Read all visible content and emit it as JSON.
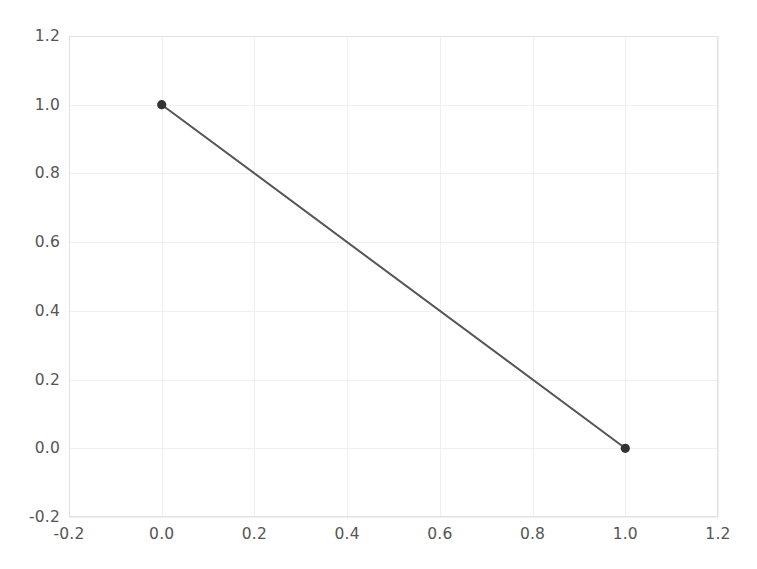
{
  "chart_data": {
    "type": "line",
    "title": "",
    "xlabel": "",
    "ylabel": "",
    "xlim": [
      -0.2,
      1.2
    ],
    "ylim": [
      -0.2,
      1.2
    ],
    "grid": true,
    "legend": null,
    "legend_position": "none",
    "x": [
      0.0,
      1.0
    ],
    "series": [
      {
        "name": "line-1",
        "values": [
          1.0,
          0.0
        ],
        "color": "#555555",
        "marker": "circle",
        "marker_color": "#333333",
        "linewidth": 2
      }
    ],
    "points": [
      {
        "x": 0.0,
        "y": 1.0
      },
      {
        "x": 1.0,
        "y": 0.0
      }
    ],
    "xticks": [
      -0.2,
      0.0,
      0.2,
      0.4,
      0.6,
      0.8,
      1.0,
      1.2
    ],
    "xtick_labels": [
      "-0.2",
      "0.0",
      "0.2",
      "0.4",
      "0.6",
      "0.8",
      "1.0",
      "1.2"
    ],
    "yticks": [
      -0.2,
      0.0,
      0.2,
      0.4,
      0.6,
      0.8,
      1.0,
      1.2
    ],
    "ytick_labels": [
      "-0.2",
      "0.0",
      "0.2",
      "0.4",
      "0.6",
      "0.8",
      "1.0",
      "1.2"
    ],
    "colors": {
      "background": "#ffffff",
      "grid": "#efefef",
      "spine": "#e2e2e2",
      "tick_text": "#555555",
      "line": "#555555",
      "marker": "#333333"
    }
  }
}
